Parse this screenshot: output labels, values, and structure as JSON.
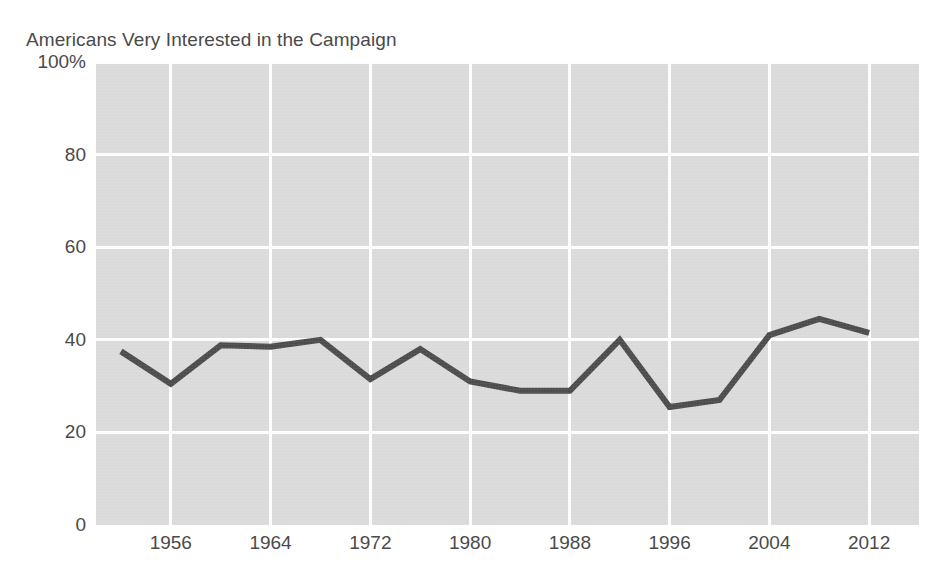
{
  "chart_data": {
    "type": "line",
    "title": "Americans Very Interested in the Campaign",
    "xlabel": "",
    "ylabel": "",
    "x": [
      1952,
      1956,
      1960,
      1964,
      1968,
      1972,
      1976,
      1980,
      1984,
      1988,
      1992,
      1996,
      2000,
      2004,
      2008,
      2012
    ],
    "values": [
      37.5,
      30.5,
      38.8,
      38.5,
      40.0,
      31.5,
      38.0,
      31.0,
      29.0,
      29.0,
      40.0,
      25.5,
      27.0,
      41.0,
      44.5,
      41.5
    ],
    "series": [
      {
        "name": "Americans Very Interested in the Campaign",
        "values": [
          37.5,
          30.5,
          38.8,
          38.5,
          40.0,
          31.5,
          38.0,
          31.0,
          29.0,
          29.0,
          40.0,
          25.5,
          27.0,
          41.0,
          44.5,
          41.5
        ]
      }
    ],
    "ylim": [
      0,
      100
    ],
    "xlim": [
      1950,
      2016
    ],
    "y_ticks": [
      0,
      20,
      40,
      60,
      80,
      100
    ],
    "y_tick_labels": [
      "0",
      "20",
      "40",
      "60",
      "80",
      "100%"
    ],
    "x_ticks": [
      1956,
      1964,
      1972,
      1980,
      1988,
      1996,
      2004,
      2012
    ],
    "x_tick_labels": [
      "1956",
      "1964",
      "1972",
      "1980",
      "1988",
      "1996",
      "2004",
      "2012"
    ],
    "grid": true,
    "grid_color": "#ffffff",
    "plot_background": "#dcdcdc",
    "line_color": "#4d4d4d",
    "line_width": 6,
    "legend": null,
    "legend_position": "none"
  }
}
